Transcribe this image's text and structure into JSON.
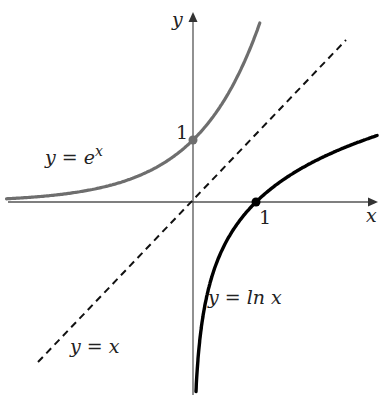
{
  "chart_data": {
    "type": "line",
    "title": "",
    "xlabel": "x",
    "ylabel": "y",
    "xlim": [
      -3,
      2.9
    ],
    "ylim": [
      -3.1,
      3.0
    ],
    "grid": false,
    "legend": "inline labels",
    "series": [
      {
        "name": "y = e^x",
        "function": "exp(x)",
        "color": "#6e6e6e",
        "style": "solid",
        "x": [
          -3,
          -2,
          -1,
          0,
          0.5,
          1,
          1.07
        ],
        "y": [
          0.05,
          0.14,
          0.37,
          1,
          1.65,
          2.72,
          2.9
        ]
      },
      {
        "name": "y = ln x",
        "function": "ln(x)",
        "color": "#000000",
        "style": "solid",
        "x": [
          0.047,
          0.1,
          0.25,
          0.5,
          1,
          2,
          2.9
        ],
        "y": [
          -3.06,
          -2.3,
          -1.39,
          -0.69,
          0,
          0.69,
          1.06
        ]
      },
      {
        "name": "y = x",
        "function": "x",
        "color": "#000000",
        "style": "dashed",
        "x": [
          -2.5,
          2.5
        ],
        "y": [
          -2.5,
          2.5
        ]
      }
    ],
    "annotations": [
      {
        "text": "1",
        "at": "y-axis tick at (0,1)",
        "marker": "point on y = e^x"
      },
      {
        "text": "1",
        "at": "x-axis tick at (1,0)",
        "marker": "point on y = ln x"
      }
    ]
  },
  "labels": {
    "x_axis": "x",
    "y_axis": "y",
    "exp_label_base": "y = e",
    "exp_label_sup": "x",
    "ln_label": "y = ln x",
    "identity_label": "y = x",
    "tick_y1": "1",
    "tick_x1": "1"
  },
  "colors": {
    "exp": "#6e6e6e",
    "ln": "#000000",
    "axis": "#555555",
    "identity": "#111111"
  }
}
